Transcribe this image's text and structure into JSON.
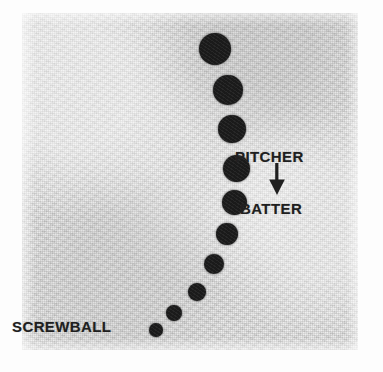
{
  "figure": {
    "name": "screwball-pitch-trajectory-photo",
    "caption_text": "SCREWBALL",
    "background_color": "#e4e4e3",
    "ball_color": "#1c1c1c",
    "text_color": "#1f1f1f",
    "plate": {
      "x": 22,
      "y": 13,
      "width": 336,
      "height": 337
    }
  },
  "labels": {
    "screwball": "SCREWBALL",
    "pitcher": "PITCHER",
    "batter": "BATTER",
    "arrow_icon": "arrow-down-icon",
    "arrow_direction": "down"
  },
  "chart_data": {
    "type": "scatter",
    "title": "SCREWBALL",
    "xlabel": "",
    "ylabel": "",
    "legend": [
      "PITCHER",
      "BATTER"
    ],
    "legend_position": "right",
    "grid": false,
    "annotations": [
      {
        "text": "SCREWBALL",
        "x": 35,
        "y": 330
      },
      {
        "text": "PITCHER",
        "x": 300,
        "y": 158
      },
      {
        "text": "BATTER",
        "x": 300,
        "y": 210
      },
      {
        "text": "arrow-down-icon",
        "x": 300,
        "y": 188
      }
    ],
    "points": [
      {
        "index": 1,
        "x": 215,
        "y": 49,
        "radius": 16.0
      },
      {
        "index": 2,
        "x": 228,
        "y": 90,
        "radius": 15.0
      },
      {
        "index": 3,
        "x": 232,
        "y": 129,
        "radius": 14.0
      },
      {
        "index": 4,
        "x": 236,
        "y": 168,
        "radius": 13.5
      },
      {
        "index": 5,
        "x": 234,
        "y": 202,
        "radius": 12.5
      },
      {
        "index": 6,
        "x": 227,
        "y": 234,
        "radius": 11.0
      },
      {
        "index": 7,
        "x": 214,
        "y": 264,
        "radius": 10.0
      },
      {
        "index": 8,
        "x": 197,
        "y": 292,
        "radius": 9.0
      },
      {
        "index": 9,
        "x": 174,
        "y": 313,
        "radius": 8.0
      },
      {
        "index": 10,
        "x": 156,
        "y": 330,
        "radius": 7.0
      }
    ],
    "xlim": [
      0,
      383
    ],
    "ylim": [
      372,
      0
    ]
  }
}
